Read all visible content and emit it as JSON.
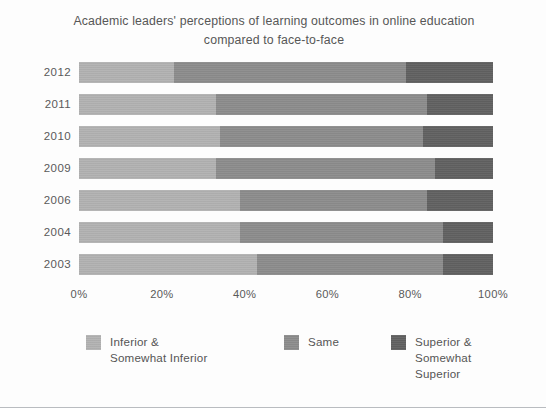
{
  "chart_data": {
    "type": "bar",
    "orientation": "horizontal",
    "stacked": true,
    "normalized_percent": true,
    "title": "Academic leaders' perceptions of learning outcomes in online education compared to face-to-face",
    "title_line1": "Academic leaders' perceptions of learning outcomes in online education",
    "title_line2": "compared to face-to-face",
    "xlabel": "",
    "ylabel": "",
    "xlim": [
      0,
      100
    ],
    "xticks": [
      "0%",
      "20%",
      "40%",
      "60%",
      "80%",
      "100%"
    ],
    "xtick_values": [
      0,
      20,
      40,
      60,
      80,
      100
    ],
    "grid": false,
    "legend_position": "bottom",
    "categories": [
      "2012",
      "2011",
      "2010",
      "2009",
      "2006",
      "2004",
      "2003"
    ],
    "series": [
      {
        "name": "Inferior & Somewhat Inferior",
        "name_line1": "Inferior &",
        "name_line2": "Somewhat Inferior",
        "color": "#b2b2b2",
        "values": [
          23,
          33,
          34,
          33,
          39,
          39,
          43
        ]
      },
      {
        "name": "Same",
        "name_line1": "Same",
        "name_line2": "",
        "color": "#8c8c8c",
        "values": [
          56,
          51,
          49,
          53,
          45,
          49,
          45
        ]
      },
      {
        "name": "Superior & Somewhat Superior",
        "name_line1": "Superior &",
        "name_line2": "Somewhat Superior",
        "color": "#616161",
        "values": [
          21,
          16,
          17,
          14,
          16,
          12,
          12
        ]
      }
    ]
  },
  "colors": {
    "background": "#fdfdfd",
    "text": "#575757",
    "border": "#b9bcc0"
  }
}
